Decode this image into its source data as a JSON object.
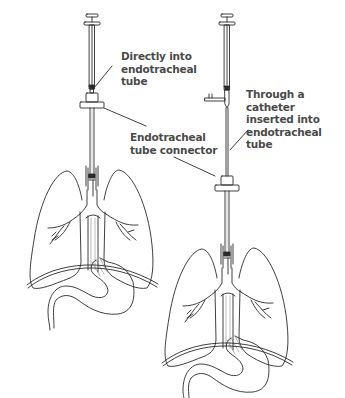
{
  "diagram": {
    "type": "medical-illustration",
    "colors": {
      "line": "#2a2a2a",
      "label_text": "#4a4a4a",
      "background": "#ffffff"
    },
    "panels": [
      {
        "id": "left",
        "method": "direct",
        "labels": [
          {
            "id": "directly",
            "text": "Directly into\nendotracheal\ntube"
          },
          {
            "id": "connector",
            "text": "Endotracheal\ntube connector"
          }
        ]
      },
      {
        "id": "right",
        "method": "catheter",
        "labels": [
          {
            "id": "through",
            "text": "Through a catheter\ninserted into\nendotracheal tube"
          }
        ]
      }
    ]
  }
}
